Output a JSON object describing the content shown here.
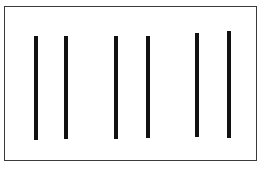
{
  "figure": {
    "frame": {
      "x": 4,
      "y": 6,
      "width": 253,
      "height": 155,
      "stroke": "#3a3a3a"
    },
    "line_color": "#111111",
    "line_width": 4,
    "lines": [
      {
        "x": 36,
        "y1": 36,
        "y2": 140
      },
      {
        "x": 66,
        "y1": 36,
        "y2": 139
      },
      {
        "x": 116,
        "y1": 36,
        "y2": 139
      },
      {
        "x": 148,
        "y1": 36,
        "y2": 138
      },
      {
        "x": 197,
        "y1": 33,
        "y2": 137
      },
      {
        "x": 229,
        "y1": 31,
        "y2": 138
      }
    ]
  }
}
